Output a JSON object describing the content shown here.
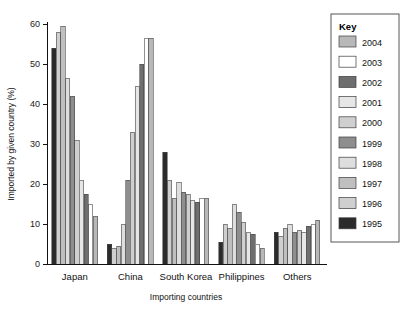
{
  "chart_data": {
    "type": "bar",
    "title": "",
    "xlabel": "Importing countries",
    "ylabel": "Imported by given country (%)",
    "categories": [
      "Japan",
      "China",
      "South Korea",
      "Philippines",
      "Others"
    ],
    "ylim": [
      0,
      60
    ],
    "yticks": [
      0,
      10,
      20,
      30,
      40,
      50,
      60
    ],
    "ytick_labels": [
      "0",
      "10",
      "20",
      "30",
      "40",
      "50",
      "60"
    ],
    "grid": false,
    "legend_position": "top-right",
    "legend_title": "Key",
    "series": [
      {
        "name": "1995",
        "color": "#2b2b2b",
        "values": [
          54,
          5,
          28,
          5.5,
          8
        ]
      },
      {
        "name": "1996",
        "color": "#cfcfcf",
        "values": [
          58,
          4,
          21,
          10,
          7
        ]
      },
      {
        "name": "1997",
        "color": "#bfbfbf",
        "values": [
          59.5,
          4.5,
          16.5,
          9,
          9
        ]
      },
      {
        "name": "1998",
        "color": "#dedede",
        "values": [
          46.5,
          10,
          20.5,
          15,
          10
        ]
      },
      {
        "name": "1999",
        "color": "#8e8e8e",
        "values": [
          42,
          21,
          18,
          13,
          8
        ]
      },
      {
        "name": "2000",
        "color": "#cfcfcf",
        "values": [
          31,
          33,
          17.5,
          10.5,
          8.5
        ]
      },
      {
        "name": "2001",
        "color": "#e6e6e6",
        "values": [
          21,
          44.5,
          16,
          8,
          8
        ]
      },
      {
        "name": "2002",
        "color": "#6e6e6e",
        "values": [
          17.5,
          50,
          15.5,
          7.5,
          9.5
        ]
      },
      {
        "name": "2003",
        "color": "#ffffff",
        "values": [
          15,
          56.5,
          16.5,
          5,
          10
        ]
      },
      {
        "name": "2004",
        "color": "#b8b8b8",
        "values": [
          12,
          56.5,
          16.5,
          4,
          11
        ]
      }
    ]
  },
  "legend": {
    "title": "Key",
    "entries": [
      {
        "label": "2004",
        "color": "#b8b8b8"
      },
      {
        "label": "2003",
        "color": "#ffffff"
      },
      {
        "label": "2002",
        "color": "#6e6e6e"
      },
      {
        "label": "2001",
        "color": "#e6e6e6"
      },
      {
        "label": "2000",
        "color": "#cfcfcf"
      },
      {
        "label": "1999",
        "color": "#8e8e8e"
      },
      {
        "label": "1998",
        "color": "#dedede"
      },
      {
        "label": "1997",
        "color": "#bfbfbf"
      },
      {
        "label": "1996",
        "color": "#cfcfcf"
      },
      {
        "label": "1995",
        "color": "#2b2b2b"
      }
    ]
  },
  "axes": {
    "y_title": "Imported by given country (%)",
    "x_title": "Importing countries"
  }
}
